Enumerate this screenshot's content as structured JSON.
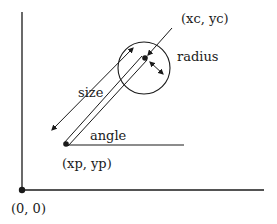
{
  "diagram": {
    "labels": {
      "center": "(xc, yc)",
      "radius": "radius",
      "size": "size",
      "angle": "angle",
      "pivot": "(xp, yp)",
      "origin": "(0, 0)"
    },
    "colors": {
      "stroke": "#1a1a1a",
      "background": "#ffffff"
    }
  }
}
